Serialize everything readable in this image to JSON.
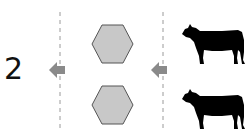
{
  "diagram": {
    "step_label": "2",
    "colors": {
      "hexagon_fill": "#c8c8c8",
      "hexagon_stroke": "#555555",
      "arrow": "#8a8a8a",
      "divider": "#9a9a9a",
      "cow": "#000000"
    },
    "hexagons": [
      {
        "name": "hexagon-top"
      },
      {
        "name": "hexagon-bottom"
      }
    ],
    "cows": [
      {
        "name": "cow-top"
      },
      {
        "name": "cow-bottom"
      }
    ],
    "arrows": [
      {
        "name": "arrow-left-outer",
        "direction": "left"
      },
      {
        "name": "arrow-left-inner",
        "direction": "left"
      }
    ]
  }
}
